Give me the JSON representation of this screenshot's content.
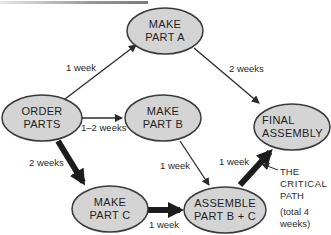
{
  "diagram": {
    "type": "critical-path-network",
    "nodes": [
      {
        "id": "order",
        "line1": "ORDER",
        "line2": "PARTS"
      },
      {
        "id": "partA",
        "line1": "MAKE",
        "line2": "PART A"
      },
      {
        "id": "partB",
        "line1": "MAKE",
        "line2": "PART B"
      },
      {
        "id": "partC",
        "line1": "MAKE",
        "line2": "PART C"
      },
      {
        "id": "assembleBC",
        "line1": "ASSEMBLE",
        "line2": "PART B + C"
      },
      {
        "id": "final",
        "line1": "FINAL",
        "line2": "ASSEMBLY"
      }
    ],
    "edges": [
      {
        "from": "order",
        "to": "partA",
        "label": "1 week",
        "critical": false
      },
      {
        "from": "order",
        "to": "partB",
        "label": "1–2 weeks",
        "critical": false
      },
      {
        "from": "order",
        "to": "partC",
        "label": "2 weeks",
        "critical": true
      },
      {
        "from": "partA",
        "to": "final",
        "label": "2 weeks",
        "critical": false
      },
      {
        "from": "partB",
        "to": "assembleBC",
        "label": "1 week",
        "critical": false
      },
      {
        "from": "partC",
        "to": "assembleBC",
        "label": "1 week",
        "critical": true
      },
      {
        "from": "assembleBC",
        "to": "final",
        "label": "1 week",
        "critical": true
      }
    ],
    "annotation": {
      "line1": "THE",
      "line2": "CRITICAL",
      "line3": "PATH",
      "line4": "(total 4",
      "line5": "weeks)"
    },
    "colors": {
      "node_fill": "#d4d4d4",
      "node_stroke": "#3a3a3a",
      "edge": "#2a2a2a"
    }
  }
}
